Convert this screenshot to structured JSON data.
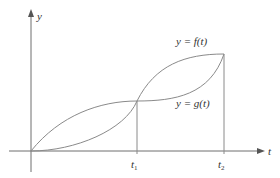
{
  "figure": {
    "axes": {
      "x_label": "t",
      "y_label": "y"
    },
    "ticks": {
      "t1": {
        "base": "t",
        "sub": "1"
      },
      "t2": {
        "base": "t",
        "sub": "2"
      }
    },
    "curves": [
      {
        "name": "f",
        "label": "y = f(t)",
        "shape": "below g on (0,t1), crosses at t1, above g on (t1,t2), meets g at t2"
      },
      {
        "name": "g",
        "label": "y = g(t)",
        "shape": "above f on (0,t1), crosses at t1, below f on (t1,t2), meets f at t2"
      }
    ],
    "colors": {
      "axis": "#6e6e6e",
      "curve": "#8a8a8a",
      "text": "#333333",
      "background": "#ffffff"
    }
  }
}
